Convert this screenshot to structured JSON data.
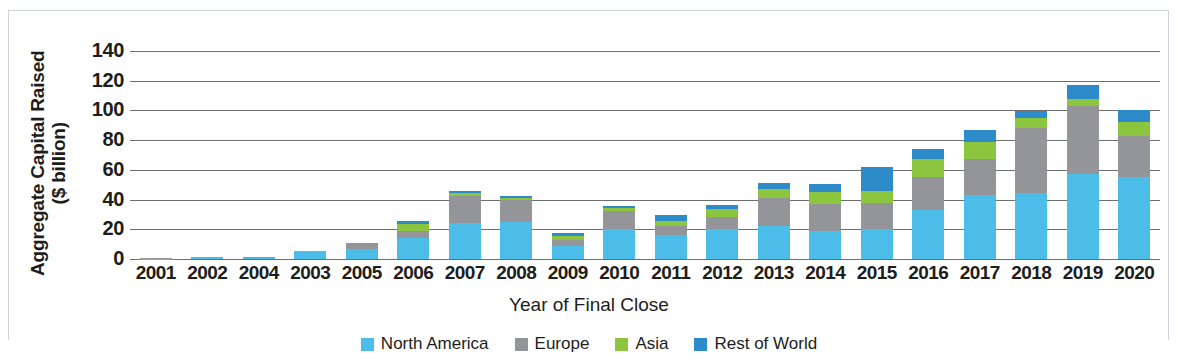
{
  "axis": {
    "y_title_line1": "Aggregate Capital Raised",
    "y_title_line2": "($ billion)",
    "x_title": "Year of Final Close"
  },
  "legend": [
    {
      "label": "North America",
      "color": "#4cbde8"
    },
    {
      "label": "Europe",
      "color": "#939598"
    },
    {
      "label": "Asia",
      "color": "#8cc63e"
    },
    {
      "label": "Rest of World",
      "color": "#2e8bc9"
    }
  ],
  "chart_data": {
    "type": "bar",
    "subtype": "stacked-vertical",
    "title": "",
    "xlabel": "Year of Final Close",
    "ylabel": "Aggregate Capital Raised ($ billion)",
    "ylim": [
      0,
      140
    ],
    "yticks": [
      0,
      20,
      40,
      60,
      80,
      100,
      120,
      140
    ],
    "grid": true,
    "legend_position": "bottom",
    "categories": [
      "2001",
      "2002",
      "2004",
      "2003",
      "2005",
      "2006",
      "2007",
      "2008",
      "2009",
      "2010",
      "2011",
      "2012",
      "2013",
      "2014",
      "2015",
      "2016",
      "2017",
      "2018",
      "2019",
      "2020"
    ],
    "series": [
      {
        "name": "North America",
        "color": "#4cbde8",
        "values": [
          0.3,
          1.2,
          1.0,
          4.6,
          7.0,
          14.0,
          24.5,
          25.0,
          9.0,
          20.5,
          16.0,
          20.0,
          22.5,
          19.0,
          20.0,
          33.0,
          43.0,
          44.5,
          57.0,
          55.0
        ]
      },
      {
        "name": "Europe",
        "color": "#939598",
        "values": [
          0.1,
          0.2,
          0.2,
          0.4,
          3.5,
          5.0,
          18.0,
          14.5,
          3.5,
          11.5,
          6.5,
          8.0,
          18.5,
          18.0,
          18.0,
          22.0,
          24.5,
          44.0,
          46.0,
          28.0
        ]
      },
      {
        "name": "Asia",
        "color": "#8cc63e",
        "values": [
          0.0,
          0.1,
          0.1,
          0.2,
          0.3,
          4.5,
          2.0,
          1.5,
          3.0,
          2.5,
          3.0,
          5.5,
          6.0,
          8.0,
          8.0,
          12.0,
          11.5,
          6.5,
          5.0,
          9.5
        ]
      },
      {
        "name": "Rest of World",
        "color": "#2e8bc9",
        "values": [
          0.0,
          0.0,
          0.0,
          0.1,
          0.2,
          2.0,
          1.5,
          1.5,
          2.0,
          1.5,
          4.0,
          3.0,
          4.5,
          5.5,
          16.0,
          7.0,
          8.0,
          4.5,
          9.0,
          8.0
        ]
      }
    ],
    "totals": [
      0.4,
      1.5,
      1.3,
      5.3,
      11.0,
      25.5,
      46.0,
      42.5,
      17.5,
      36.0,
      29.5,
      36.5,
      51.5,
      50.5,
      62.0,
      74.0,
      87.0,
      99.5,
      117.0,
      100.5
    ]
  }
}
